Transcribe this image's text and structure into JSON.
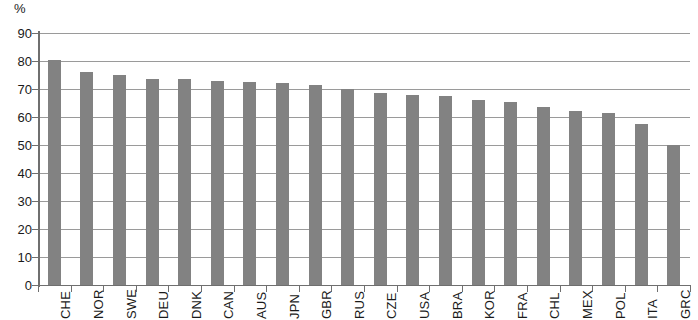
{
  "chart_data": {
    "type": "bar",
    "title": "",
    "subtitle": "",
    "xlabel": "",
    "ylabel": "%",
    "unit_label": "%",
    "ylim": [
      0,
      90
    ],
    "ytick_step": 10,
    "yticks": [
      90,
      80,
      70,
      60,
      50,
      40,
      30,
      20,
      10,
      0
    ],
    "ytick_labels": [
      "90",
      "80",
      "70",
      "60",
      "50",
      "40",
      "30",
      "20",
      "10",
      "0"
    ],
    "grid": true,
    "grid_axis": "y",
    "legend": false,
    "legend_position": "none",
    "bar_color": "#828282",
    "axis_color": "#6f6f6f",
    "gridline_color": "#9a9a9a",
    "categories": [
      "CHE",
      "NOR",
      "SWE",
      "DEU",
      "DNK",
      "CAN",
      "AUS",
      "JPN",
      "GBR",
      "RUS",
      "CZE",
      "USA",
      "BRA",
      "KOR",
      "FRA",
      "CHL",
      "MEX",
      "POL",
      "ITA",
      "GRC"
    ],
    "values": [
      80.5,
      76,
      75,
      73.5,
      73.5,
      73,
      72.5,
      72,
      71.5,
      70,
      68.5,
      68,
      67.5,
      66,
      65.5,
      63.5,
      62,
      61.5,
      57.5,
      50
    ],
    "series": [
      {
        "name": "",
        "values": [
          80.5,
          76,
          75,
          73.5,
          73.5,
          73,
          72.5,
          72,
          71.5,
          70,
          68.5,
          68,
          67.5,
          66,
          65.5,
          63.5,
          62,
          61.5,
          57.5,
          50
        ]
      }
    ]
  }
}
